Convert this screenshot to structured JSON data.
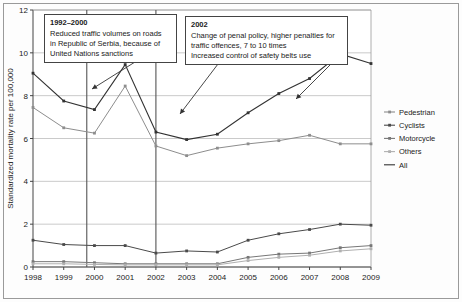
{
  "chart_data": {
    "type": "line",
    "title": "",
    "xlabel": "",
    "ylabel": "Standardized mortality rate per 100,000",
    "x": [
      1998,
      1999,
      2000,
      2001,
      2002,
      2003,
      2004,
      2005,
      2006,
      2007,
      2008,
      2009
    ],
    "xticklabels": [
      "1998",
      "1999",
      "2000",
      "2001",
      "2002",
      "2003",
      "2004",
      "2005",
      "2006",
      "2007",
      "2008",
      "2009"
    ],
    "yticks": [
      0,
      2,
      4,
      6,
      8,
      10,
      12
    ],
    "yticklabels": [
      "0",
      "2",
      "4",
      "6",
      "8",
      "10",
      "12"
    ],
    "ylim": [
      0,
      12
    ],
    "grid": true,
    "legend_position": "right",
    "series": [
      {
        "name": "Pedestrian",
        "color": "#8d8d8d",
        "values": [
          7.45,
          6.5,
          6.25,
          8.45,
          5.65,
          5.2,
          5.55,
          5.75,
          5.9,
          6.15,
          5.75,
          5.75
        ]
      },
      {
        "name": "Cyclists",
        "color": "#4a4a4a",
        "values": [
          1.25,
          1.05,
          1.0,
          1.0,
          0.65,
          0.75,
          0.7,
          1.25,
          1.55,
          1.75,
          2.0,
          1.95
        ]
      },
      {
        "name": "Motorcycle",
        "color": "#777777",
        "values": [
          0.25,
          0.25,
          0.2,
          0.15,
          0.15,
          0.15,
          0.15,
          0.45,
          0.6,
          0.65,
          0.9,
          1.0
        ]
      },
      {
        "name": "Others",
        "color": "#b0b0b0",
        "values": [
          0.15,
          0.15,
          0.12,
          0.1,
          0.1,
          0.1,
          0.1,
          0.3,
          0.45,
          0.55,
          0.75,
          0.85
        ]
      },
      {
        "name": "All",
        "color": "#333333",
        "values": [
          9.05,
          7.75,
          7.35,
          9.45,
          6.3,
          5.95,
          6.2,
          7.2,
          8.1,
          8.8,
          9.95,
          9.5
        ]
      }
    ],
    "vertical_markers": [
      {
        "name": "marker-2000",
        "x": 1999.75
      },
      {
        "name": "marker-2002",
        "x": 2002.0
      }
    ],
    "annotations": [
      {
        "id": "anno-1992",
        "title": "1992–2000",
        "lines": [
          "Reduced traffic volumes on roads",
          "in Republic of Serbia, because of",
          "United Nations sanctions"
        ],
        "arrow_from": {
          "x": 135,
          "y": 62
        },
        "arrow_to": {
          "x": 92,
          "y": 89
        }
      },
      {
        "id": "anno-2002",
        "title": "2002",
        "lines": [
          "Change of penal policy, higher penalties for",
          "traffic offences, 7 to 10 times",
          "Increased control of safety belts use"
        ],
        "arrow_from": {
          "x": 218,
          "y": 64
        },
        "arrow_to": {
          "x": 180,
          "y": 114
        },
        "arrow2_from": {
          "x": 330,
          "y": 65
        },
        "arrow2_to": {
          "x": 296,
          "y": 99
        }
      }
    ]
  },
  "legend": {
    "items": [
      {
        "label": "Pedestrian"
      },
      {
        "label": "Cyclists"
      },
      {
        "label": "Motorcycle"
      },
      {
        "label": "Others"
      },
      {
        "label": "All"
      }
    ]
  }
}
